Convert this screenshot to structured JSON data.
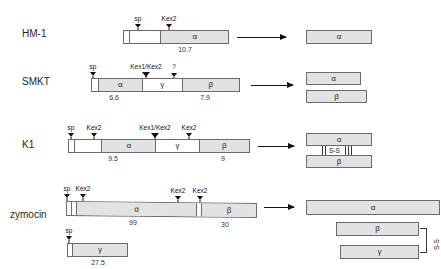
{
  "figure": {
    "type": "protein-precursor-processing-diagram"
  },
  "rows": [
    {
      "name": "HM-1",
      "label": "HM-1",
      "precursor": {
        "segments": [
          {
            "id": "sp",
            "label": "",
            "style": "empty",
            "width_pct": 5
          },
          {
            "id": "pro",
            "label": "",
            "style": "empty",
            "width_pct": 30
          },
          {
            "id": "alpha",
            "label": "α",
            "style": "fill",
            "width_pct": 65
          }
        ],
        "markers": [
          {
            "label": "sp",
            "pos_pct": 5
          },
          {
            "label": "Kex2",
            "pos_pct": 35
          }
        ],
        "mw": [
          {
            "value": "10.7",
            "pos_pct": 67
          }
        ]
      },
      "products": [
        {
          "label": "α",
          "width_px": 66
        }
      ],
      "disulfide": null
    },
    {
      "name": "SMKT",
      "label": "SMKT",
      "precursor": {
        "segments": [
          {
            "id": "sp",
            "label": "",
            "style": "empty",
            "width_pct": 4
          },
          {
            "id": "alpha",
            "label": "α",
            "style": "fill",
            "width_pct": 30
          },
          {
            "id": "gamma",
            "label": "γ",
            "style": "empty",
            "width_pct": 27
          },
          {
            "id": "beta",
            "label": "β",
            "style": "fill",
            "width_pct": 39
          }
        ],
        "markers": [
          {
            "label": "sp",
            "pos_pct": 4
          },
          {
            "label": "Kex1/Kex2",
            "pos_pct": 34
          },
          {
            "label": "?",
            "pos_pct": 61
          }
        ],
        "mw": [
          {
            "value": "6.6",
            "pos_pct": 19
          },
          {
            "value": "7.9",
            "pos_pct": 80
          }
        ]
      },
      "products": [
        {
          "label": "α",
          "width_px": 55
        },
        {
          "label": "β",
          "width_px": 61
        }
      ],
      "disulfide": null
    },
    {
      "name": "K1",
      "label": "K1",
      "precursor": {
        "segments": [
          {
            "id": "sp",
            "label": "",
            "style": "empty",
            "width_pct": 3
          },
          {
            "id": "pro",
            "label": "",
            "style": "empty",
            "width_pct": 15
          },
          {
            "id": "alpha",
            "label": "α",
            "style": "fill",
            "width_pct": 30
          },
          {
            "id": "gamma",
            "label": "γ",
            "style": "empty",
            "width_pct": 24
          },
          {
            "id": "beta",
            "label": "β",
            "style": "fill",
            "width_pct": 28
          }
        ],
        "markers": [
          {
            "label": "sp",
            "pos_pct": 3
          },
          {
            "label": "Kex2",
            "pos_pct": 18
          },
          {
            "label": "Kex1/Kex2",
            "pos_pct": 48
          },
          {
            "label": "Kex2",
            "pos_pct": 72
          }
        ],
        "mw": [
          {
            "value": "9.5",
            "pos_pct": 33
          },
          {
            "value": "9",
            "pos_pct": 86
          }
        ]
      },
      "products": [
        {
          "label": "α",
          "width_px": 66
        },
        {
          "label": "β",
          "width_px": 66
        }
      ],
      "disulfide": {
        "label": "S-S"
      }
    },
    {
      "name": "zymocin",
      "label": "zymocin",
      "precursor": {
        "segments": [
          {
            "id": "sp",
            "label": "",
            "style": "empty",
            "width_pct": 2
          },
          {
            "id": "pro",
            "label": "",
            "style": "empty",
            "width_pct": 3
          },
          {
            "id": "alpha",
            "label": "α",
            "style": "fill",
            "width_pct": 63
          },
          {
            "id": "spacer",
            "label": "",
            "style": "empty",
            "width_pct": 3
          },
          {
            "id": "beta",
            "label": "β",
            "style": "fill",
            "width_pct": 29
          }
        ],
        "markers": [
          {
            "label": "sp",
            "pos_pct": 2
          },
          {
            "label": "Kex2",
            "pos_pct": 5
          },
          {
            "label": "Kex2",
            "pos_pct": 66
          },
          {
            "label": "Kex2",
            "pos_pct": 71
          }
        ],
        "mw": [
          {
            "value": "99",
            "pos_pct": 36
          },
          {
            "value": "30",
            "pos_pct": 85
          }
        ]
      },
      "secondary": {
        "segments": [
          {
            "id": "sp",
            "label": "",
            "style": "empty",
            "width_pct": 7
          },
          {
            "id": "gamma",
            "label": "γ",
            "style": "fill",
            "width_pct": 93
          }
        ],
        "markers": [
          {
            "label": "sp",
            "pos_pct": 7
          }
        ],
        "mw": [
          {
            "value": "27.5",
            "pos_pct": 50
          }
        ]
      },
      "products": [
        {
          "label": "α",
          "width_px": 134
        },
        {
          "label": "β",
          "width_px": 83
        },
        {
          "label": "γ",
          "width_px": 79
        }
      ],
      "disulfide": {
        "label": "S-S"
      }
    }
  ],
  "icons": {
    "arrow": "right-arrow-icon",
    "site_marker": "cleavage-site-marker-icon"
  },
  "colors": {
    "domain_fill": "#e2e2e2",
    "outline": "#6b6b6b",
    "text": "#1a1a1a",
    "marker": "#111111"
  }
}
